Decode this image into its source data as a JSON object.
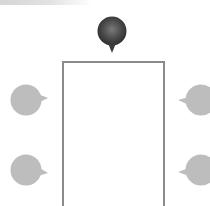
{
  "diagram": {
    "type": "seating-layout",
    "header_band": {
      "visible": true
    },
    "table": {
      "shape": "rectangle",
      "border_color": "#8a8a8a",
      "fill_color": "#ffffff"
    },
    "markers": [
      {
        "id": "head",
        "position": "top-center",
        "points": "down",
        "style": "dark",
        "color": "#4a4a4a"
      },
      {
        "id": "left-1",
        "position": "left-upper",
        "points": "right",
        "style": "light",
        "color": "#b8b8b8"
      },
      {
        "id": "left-2",
        "position": "left-lower",
        "points": "right",
        "style": "light",
        "color": "#b8b8b8"
      },
      {
        "id": "right-1",
        "position": "right-upper",
        "points": "left",
        "style": "light",
        "color": "#b8b8b8"
      },
      {
        "id": "right-2",
        "position": "right-lower",
        "points": "left",
        "style": "light",
        "color": "#b8b8b8"
      }
    ]
  }
}
